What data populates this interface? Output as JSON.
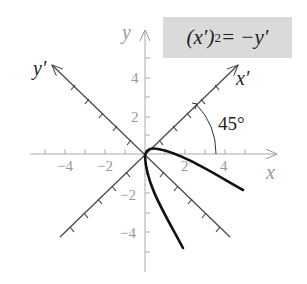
{
  "diagram": {
    "equation": {
      "lhs_base": "(x′)",
      "lhs_exp": "2",
      "rhs": " = −y′"
    },
    "axes": {
      "x_label": "x",
      "y_label": "y",
      "x_prime_label": "x′",
      "y_prime_label": "y′",
      "x_ticks": [
        "−4",
        "−2",
        "2",
        "4"
      ],
      "y_ticks": [
        "4",
        "2",
        "−2",
        "−4"
      ]
    },
    "rotation_angle": "45°",
    "curve": "parabola (x′)² = −y′ opening along negative y′ axis",
    "colors": {
      "axis_grey": "#999999",
      "rotated_axis": "#444444",
      "curve": "#111111",
      "equation_bg": "#dadada"
    }
  }
}
